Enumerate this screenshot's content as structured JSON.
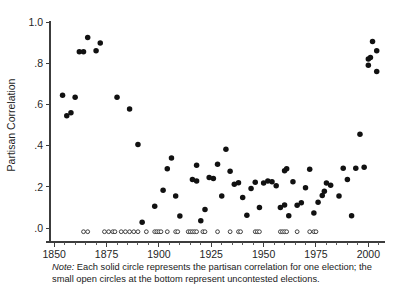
{
  "figure": {
    "note_label": "Note:",
    "note_text": " Each solid circle represents the partisan correlation for one election; the small open circles at the bottom represent uncontested elections."
  },
  "chart_data": {
    "type": "scatter",
    "title": "",
    "xlabel": "",
    "ylabel": "Partisan Correlation",
    "xlim": [
      1848,
      2007
    ],
    "ylim": [
      -0.035,
      1.0
    ],
    "grid": false,
    "legend": null,
    "y_ticks": [
      0.0,
      0.2,
      0.4,
      0.6,
      0.8,
      1.0
    ],
    "y_tick_labels": [
      ".0",
      ".2",
      ".4",
      ".6",
      ".8",
      "1.0"
    ],
    "x_ticks": [
      1850,
      1875,
      1900,
      1925,
      1950,
      1975,
      2000
    ],
    "x_tick_labels": [
      "1850",
      "1875",
      "1900",
      "1925",
      "1950",
      "1975",
      "2000"
    ],
    "x_minor_tick_step": 5,
    "series": [
      {
        "name": "Partisan correlation (contested election)",
        "marker": "solid-circle",
        "color": "#111111",
        "points": [
          [
            1854,
            0.645
          ],
          [
            1856,
            0.545
          ],
          [
            1858,
            0.56
          ],
          [
            1860,
            0.635
          ],
          [
            1862,
            0.855
          ],
          [
            1864,
            0.855
          ],
          [
            1866,
            0.925
          ],
          [
            1870,
            0.86
          ],
          [
            1872,
            0.898
          ],
          [
            1880,
            0.635
          ],
          [
            1886,
            0.578
          ],
          [
            1890,
            0.405
          ],
          [
            1892,
            0.028
          ],
          [
            1898,
            0.105
          ],
          [
            1902,
            0.183
          ],
          [
            1904,
            0.288
          ],
          [
            1906,
            0.34
          ],
          [
            1908,
            0.155
          ],
          [
            1910,
            0.058
          ],
          [
            1916,
            0.235
          ],
          [
            1918,
            0.228
          ],
          [
            1918,
            0.305
          ],
          [
            1920,
            0.035
          ],
          [
            1922,
            0.09
          ],
          [
            1924,
            0.245
          ],
          [
            1926,
            0.24
          ],
          [
            1928,
            0.31
          ],
          [
            1930,
            0.155
          ],
          [
            1932,
            0.382
          ],
          [
            1934,
            0.275
          ],
          [
            1936,
            0.212
          ],
          [
            1938,
            0.22
          ],
          [
            1940,
            0.148
          ],
          [
            1942,
            0.062
          ],
          [
            1944,
            0.192
          ],
          [
            1946,
            0.222
          ],
          [
            1948,
            0.1
          ],
          [
            1950,
            0.218
          ],
          [
            1952,
            0.228
          ],
          [
            1954,
            0.225
          ],
          [
            1956,
            0.205
          ],
          [
            1958,
            0.1
          ],
          [
            1960,
            0.112
          ],
          [
            1960,
            0.278
          ],
          [
            1961,
            0.288
          ],
          [
            1962,
            0.06
          ],
          [
            1964,
            0.225
          ],
          [
            1966,
            0.11
          ],
          [
            1968,
            0.122
          ],
          [
            1970,
            0.195
          ],
          [
            1972,
            0.285
          ],
          [
            1974,
            0.073
          ],
          [
            1976,
            0.125
          ],
          [
            1978,
            0.158
          ],
          [
            1979,
            0.178
          ],
          [
            1980,
            0.218
          ],
          [
            1982,
            0.208
          ],
          [
            1986,
            0.155
          ],
          [
            1988,
            0.29
          ],
          [
            1990,
            0.235
          ],
          [
            1992,
            0.06
          ],
          [
            1994,
            0.29
          ],
          [
            1996,
            0.455
          ],
          [
            1998,
            0.295
          ],
          [
            2000,
            0.79
          ],
          [
            2000,
            0.82
          ],
          [
            2001,
            0.828
          ],
          [
            2002,
            0.905
          ],
          [
            2004,
            0.86
          ],
          [
            2004,
            0.76
          ]
        ]
      },
      {
        "name": "Uncontested election",
        "marker": "open-circle",
        "color": "#ffffff",
        "y_value": -0.018,
        "x_values": [
          1864,
          1866,
          1874,
          1876,
          1878,
          1879,
          1882,
          1884,
          1886,
          1888,
          1890,
          1894,
          1898,
          1899,
          1900,
          1901,
          1904,
          1908,
          1909,
          1914,
          1915,
          1916,
          1917,
          1918,
          1921,
          1922,
          1928,
          1934,
          1938,
          1939,
          1946,
          1947,
          1948,
          1958,
          1959,
          1960,
          1961,
          1966,
          1972,
          1974,
          1975
        ]
      }
    ]
  }
}
